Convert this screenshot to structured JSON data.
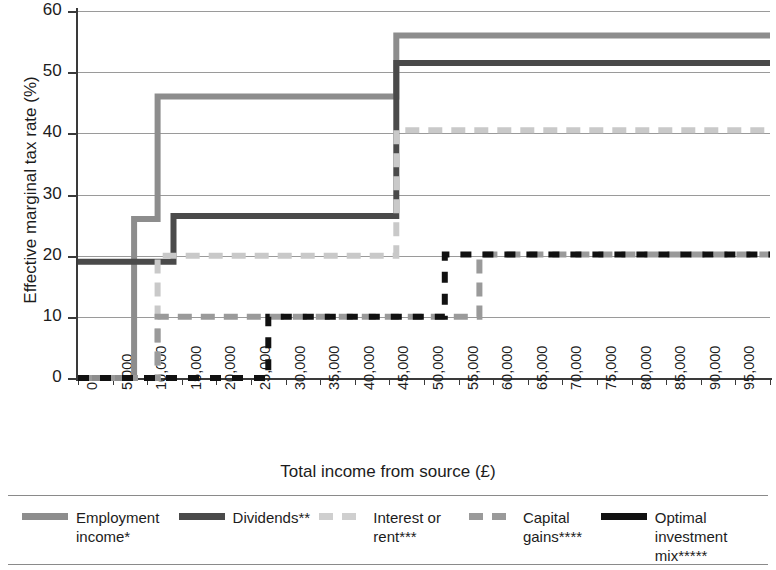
{
  "chart_data": {
    "type": "line",
    "title": "",
    "xlabel": "Total income from source (£)",
    "ylabel": "Effective marginal tax rate (%)",
    "xlim": [
      0,
      100000
    ],
    "ylim": [
      0,
      60
    ],
    "grid": true,
    "legend_position": "bottom",
    "x_ticks": [
      "0",
      "5,000",
      "10,000",
      "15,000",
      "20,000",
      "25,000",
      "30,000",
      "35,000",
      "40,000",
      "45,000",
      "50,000",
      "55,000",
      "60,000",
      "65,000",
      "70,000",
      "75,000",
      "80,000",
      "85,000",
      "90,000",
      "95,000",
      "100,000"
    ],
    "x_tick_values": [
      0,
      5000,
      10000,
      15000,
      20000,
      25000,
      30000,
      35000,
      40000,
      45000,
      50000,
      55000,
      60000,
      65000,
      70000,
      75000,
      80000,
      85000,
      90000,
      95000,
      100000
    ],
    "y_ticks": [
      "0",
      "10",
      "20",
      "30",
      "40",
      "50",
      "60"
    ],
    "y_tick_values": [
      0,
      10,
      20,
      30,
      40,
      50,
      60
    ],
    "series": [
      {
        "name": "Employment income*",
        "key": "employment",
        "color": "#8d8d8d",
        "style": "solid",
        "width": 6,
        "steps": [
          {
            "x": 0,
            "y": 0
          },
          {
            "x": 8100,
            "y": 26
          },
          {
            "x": 11500,
            "y": 46
          },
          {
            "x": 46000,
            "y": 56
          },
          {
            "x": 100000,
            "y": 56
          }
        ]
      },
      {
        "name": "Dividends**",
        "key": "dividends",
        "color": "#4a4a4a",
        "style": "solid",
        "width": 6,
        "steps": [
          {
            "x": 0,
            "y": 19
          },
          {
            "x": 13800,
            "y": 26.5
          },
          {
            "x": 46000,
            "y": 51.5
          },
          {
            "x": 100000,
            "y": 51.5
          }
        ]
      },
      {
        "name": "Interest or rent***",
        "key": "interest",
        "color": "#c9c9c9",
        "style": "dashed",
        "width": 6,
        "dash": "14,9",
        "steps": [
          {
            "x": 0,
            "y": 0
          },
          {
            "x": 11500,
            "y": 20
          },
          {
            "x": 46000,
            "y": 40.5
          },
          {
            "x": 100000,
            "y": 40.5
          }
        ]
      },
      {
        "name": "Capital gains****",
        "key": "capital",
        "color": "#9a9a9a",
        "style": "dashed",
        "width": 6,
        "dash": "14,9",
        "steps": [
          {
            "x": 0,
            "y": 0
          },
          {
            "x": 11500,
            "y": 10
          },
          {
            "x": 58000,
            "y": 20.2
          },
          {
            "x": 100000,
            "y": 20.2
          }
        ]
      },
      {
        "name": "Optimal investment mix*****",
        "key": "optimal",
        "color": "#111111",
        "style": "dashed",
        "width": 6,
        "dash": "11,11",
        "steps": [
          {
            "x": 0,
            "y": 0
          },
          {
            "x": 27500,
            "y": 10
          },
          {
            "x": 53000,
            "y": 20.2
          },
          {
            "x": 100000,
            "y": 20.2
          }
        ]
      }
    ]
  },
  "axes": {
    "y_title": "Effective marginal tax rate (%)",
    "x_title": "Total income from source (£)"
  },
  "legend": {
    "items": [
      {
        "label_line1": "Employment",
        "label_line2": "income*",
        "color": "#8d8d8d",
        "swatch": "solid",
        "name": "employment-income"
      },
      {
        "label_line1": "Dividends**",
        "label_line2": "",
        "color": "#4a4a4a",
        "swatch": "solid",
        "name": "dividends"
      },
      {
        "label_line1": "Interest or",
        "label_line2": "rent***",
        "color": "#cfcfcf",
        "swatch": "dashed",
        "name": "interest-or-rent"
      },
      {
        "label_line1": "Capital",
        "label_line2": "gains****",
        "color": "#9a9a9a",
        "swatch": "dashed",
        "name": "capital-gains"
      },
      {
        "label_line1": "Optimal investment",
        "label_line2": "mix*****",
        "color": "#111111",
        "swatch": "solid",
        "name": "optimal-investment-mix"
      }
    ]
  },
  "colors": {
    "grid": "#9a9a9a",
    "axis": "#3a3a3a",
    "text": "#1c1c1c",
    "background": "#ffffff"
  }
}
